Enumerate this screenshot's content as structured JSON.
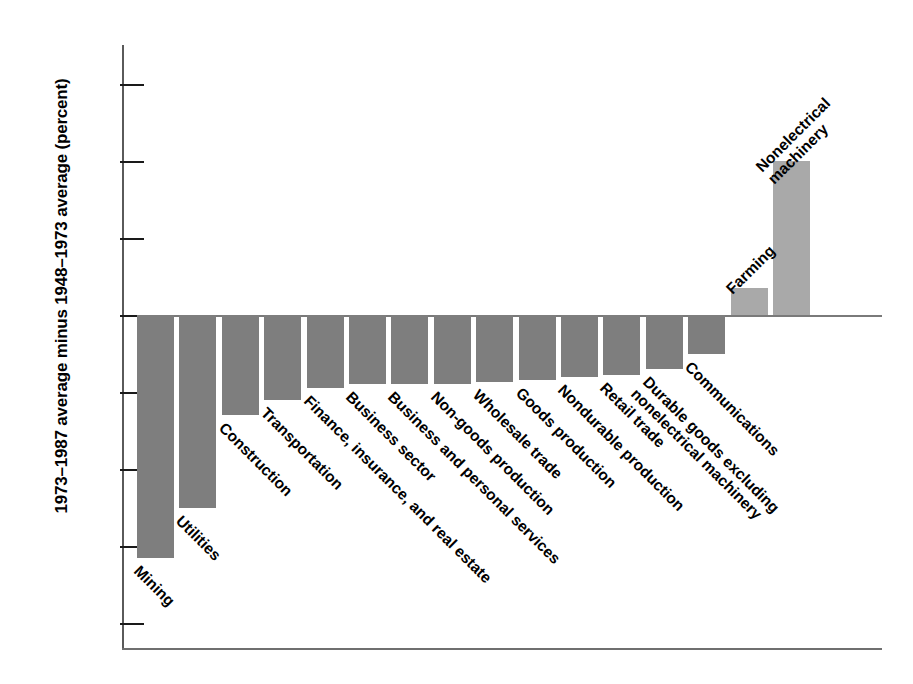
{
  "chart_data": {
    "type": "bar",
    "title": "",
    "xlabel": "",
    "ylabel": "1973–1987 average minus 1948–1973 average (percent)",
    "ylim": [
      -8,
      7
    ],
    "yticks": [
      6,
      4,
      2,
      0,
      -2,
      -4,
      -6,
      -8
    ],
    "ytick_labels": [
      "6",
      "4",
      "2",
      "0",
      "−2",
      "−4",
      "−6",
      "−8"
    ],
    "grid": false,
    "legend": "none",
    "zero_reference_line": true,
    "categories": [
      "Mining",
      "Utilities",
      "Construction",
      "Transportation",
      "Finance, insurance, and real estate",
      "Business sector",
      "Business and personal services",
      "Non-goods production",
      "Wholesale trade",
      "Goods production",
      "Nondurable production",
      "Retail trade",
      "Durable manufactured goods",
      "Communications",
      "Farming",
      "Nonelectrical machinery"
    ],
    "category_labels": [
      "Mining",
      "Utilities",
      "Construction",
      "Transportation",
      "Finance, insurance, and real estate",
      "Business sector",
      "Business and personal services",
      "Non-goods production",
      "Wholesale trade",
      "Goods production",
      "Nondurable production",
      "Retail trade",
      "Durable manufactured goods",
      "Communications",
      "Farming",
      "Nonelectrical machinery"
    ],
    "values": [
      -6.3,
      -5.0,
      -2.6,
      -2.2,
      -1.9,
      -1.8,
      -1.8,
      -1.8,
      -1.75,
      -1.7,
      -1.6,
      -1.55,
      -1.4,
      -1.0,
      0.7,
      4.0
    ],
    "series": [
      {
        "name": "Change in productivity growth",
        "values": [
          -6.3,
          -5.0,
          -2.6,
          -2.2,
          -1.9,
          -1.8,
          -1.8,
          -1.8,
          -1.75,
          -1.7,
          -1.6,
          -1.55,
          -1.4,
          -1.0,
          0.7,
          4.0
        ]
      }
    ],
    "colors": {
      "negative_bar": "#7e7e7e",
      "positive_bar": "#a9a9a9",
      "axis": "#5a5a5a",
      "text": "#000000",
      "background": "#ffffff"
    }
  },
  "annotations": {
    "nonelectrical_machinery_label": "Nonelectrical\nmachinery",
    "durable_goods_label": "Durable goods excluding\nnonelectrical machinery"
  }
}
